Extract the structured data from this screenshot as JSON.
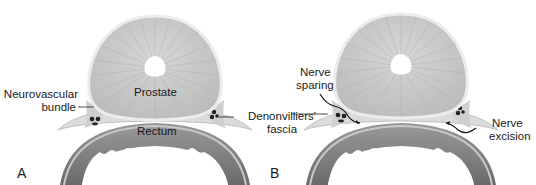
{
  "figure": {
    "panels": [
      {
        "id": "A",
        "letter": "A",
        "labels": {
          "prostate": "Prostate",
          "rectum": "Rectum",
          "neurovascular_line1": "Neurovascular",
          "neurovascular_line2": "bundle",
          "denon_line1": "Denonvilliers'",
          "denon_line2": "fascia"
        }
      },
      {
        "id": "B",
        "letter": "B",
        "labels": {
          "nerve_sparing_line1": "Nerve",
          "nerve_sparing_line2": "sparing",
          "nerve_excision_line1": "Nerve",
          "nerve_excision_line2": "excision"
        }
      }
    ],
    "colors": {
      "prostate_fill": "#c9c9c9",
      "prostate_rim": "#e6e6e6",
      "rectum_outer": "#8a8a8a",
      "rectum_inner": "#6e6e6e",
      "fascia": "#d8d8d8",
      "text": "#1a1a1a"
    }
  }
}
